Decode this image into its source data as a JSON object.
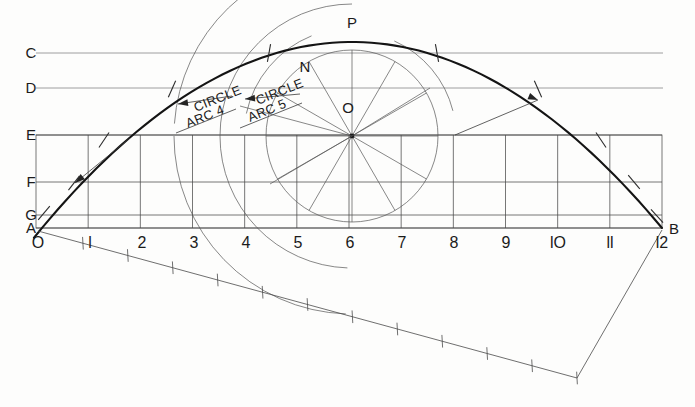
{
  "drawing": {
    "title": "Parabolic arch construction layout",
    "background_color": "#fdfdfc",
    "line_color_heavy": "#141414",
    "line_color_thin": "#555555",
    "width": 695,
    "height": 407
  },
  "datum_lines": [
    {
      "label": "C",
      "y": 53,
      "x1": 36,
      "x2": 663
    },
    {
      "label": "D",
      "y": 88,
      "x1": 36,
      "x2": 663
    },
    {
      "label": "E",
      "y": 135,
      "x1": 36,
      "x2": 662
    },
    {
      "label": "F",
      "y": 182,
      "x1": 36,
      "x2": 662
    },
    {
      "label": "G",
      "y": 215,
      "x1": 36,
      "x2": 662
    },
    {
      "label": "A",
      "y": 228,
      "x1": 36,
      "x2": 662
    }
  ],
  "label_x": 31,
  "points": [
    {
      "label": "P",
      "x": 352,
      "y": 28,
      "anchor": "middle"
    },
    {
      "label": "N",
      "x": 305,
      "y": 72,
      "anchor": "middle"
    },
    {
      "label": "O",
      "x": 348,
      "y": 113,
      "anchor": "middle"
    },
    {
      "label": "A",
      "x": 31,
      "y": 233,
      "anchor": "middle"
    },
    {
      "label": "B",
      "x": 674,
      "y": 234,
      "anchor": "middle"
    }
  ],
  "scale": {
    "baseline_y": 228,
    "label_y": 248,
    "x_start": 38,
    "x_end": 662,
    "divisions": 12,
    "numbers": [
      "O",
      "l",
      "2",
      "3",
      "4",
      "5",
      "6",
      "7",
      "8",
      "9",
      "lO",
      "ll",
      "l2"
    ]
  },
  "grid": {
    "left": 36,
    "right": 662,
    "top": 135,
    "bottom": 228,
    "horizontal_rows": [
      135,
      182,
      215,
      228
    ],
    "vertical_count": 12
  },
  "circle": {
    "center_x": 352,
    "center_y": 136,
    "radius": 86,
    "spoke_count": 12,
    "label": "construction-circle"
  },
  "arch": {
    "name": "main-parabolic-arc",
    "left_x": 34,
    "left_y": 228,
    "apex_x": 352,
    "apex_y": 42,
    "right_x": 662,
    "right_y": 228
  },
  "construction_arcs": [
    {
      "name": "circle-arc-4",
      "radius": 178,
      "start_angle": 92,
      "end_angle": 176
    },
    {
      "name": "circle-arc-5",
      "radius": 132,
      "start_angle": 90,
      "end_angle": 180
    },
    {
      "name": "circle-arc-upper-left",
      "radius": 108,
      "start_angle": 112,
      "end_angle": 168
    },
    {
      "name": "circle-arc-upper-right",
      "radius": 104,
      "start_angle": 14,
      "end_angle": 66
    }
  ],
  "notes": [
    {
      "text": "CIRCLE",
      "x": 196,
      "y": 112,
      "rotation": -22,
      "name": "circle-arc-4-note-line1"
    },
    {
      "text": "ARC 4",
      "x": 188,
      "y": 128,
      "rotation": -22,
      "name": "circle-arc-4-note-line2"
    },
    {
      "text": "CIRCLE",
      "x": 258,
      "y": 105,
      "rotation": -22,
      "name": "circle-arc-5-note-line1"
    },
    {
      "text": "ARC 5",
      "x": 250,
      "y": 122,
      "rotation": -22,
      "name": "circle-arc-5-note-line2"
    }
  ],
  "leaders": [
    {
      "name": "leader-lower-left",
      "x1": 130,
      "y1": 138,
      "x2": 75,
      "y2": 183,
      "head_angle": 219
    },
    {
      "name": "leader-lower-right",
      "x1": 455,
      "y1": 135,
      "x2": 538,
      "y2": 100,
      "head_angle": 337
    },
    {
      "name": "leader-arc4",
      "x1": 232,
      "y1": 96,
      "x2": 178,
      "y2": 104,
      "head_angle": 188
    },
    {
      "name": "leader-arc5",
      "x1": 300,
      "y1": 94,
      "x2": 245,
      "y2": 99,
      "head_angle": 185
    }
  ],
  "curve_ticks": [
    {
      "name": "tick-on-arc-0",
      "x": 44,
      "y": 213,
      "angle": 50
    },
    {
      "name": "tick-on-arc-1",
      "x": 74,
      "y": 183,
      "angle": 52
    },
    {
      "name": "tick-on-arc-2",
      "x": 104,
      "y": 140,
      "angle": 56
    },
    {
      "name": "tick-on-arc-3",
      "x": 172,
      "y": 89,
      "angle": 66
    },
    {
      "name": "tick-on-arc-4",
      "x": 269,
      "y": 53,
      "angle": 80
    },
    {
      "name": "tick-on-arc-5",
      "x": 437,
      "y": 53,
      "angle": 100
    },
    {
      "name": "tick-on-arc-6",
      "x": 538,
      "y": 89,
      "angle": 114
    },
    {
      "name": "tick-on-arc-7",
      "x": 601,
      "y": 140,
      "angle": 124
    },
    {
      "name": "tick-on-arc-8",
      "x": 634,
      "y": 182,
      "angle": 130
    },
    {
      "name": "tick-on-arc-9",
      "x": 657,
      "y": 216,
      "angle": 132
    }
  ],
  "ruler": {
    "name": "angled-measuring-scale",
    "origin_x": 38,
    "origin_y": 231,
    "end_x": 577,
    "end_y": 378,
    "tick_count": 12,
    "return_line": {
      "x1": 577,
      "y1": 378,
      "x2": 662,
      "y2": 230
    }
  },
  "spoke_chords": [
    {
      "name": "chord-upper-left",
      "x1": 352,
      "y1": 136,
      "x2": 240,
      "y2": 106
    },
    {
      "name": "chord-mid-left",
      "x1": 352,
      "y1": 136,
      "x2": 270,
      "y2": 184
    },
    {
      "name": "chord-lower-right",
      "x1": 352,
      "y1": 136,
      "x2": 430,
      "y2": 88
    }
  ]
}
